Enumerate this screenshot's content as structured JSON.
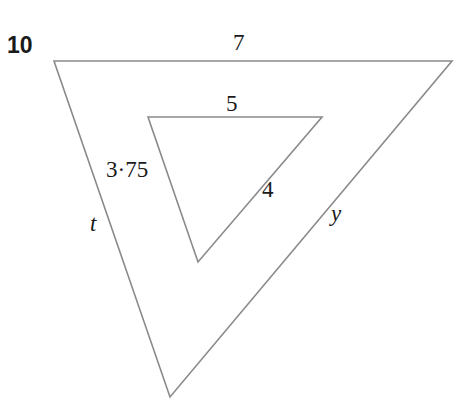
{
  "question_number": "10",
  "outer_triangle": {
    "vertices": {
      "top_left": [
        54,
        61
      ],
      "top_right": [
        452,
        61
      ],
      "bottom": [
        170,
        397
      ]
    },
    "labels": {
      "top": "7",
      "left": "t",
      "right": "y"
    }
  },
  "inner_triangle": {
    "vertices": {
      "top_left": [
        148,
        117
      ],
      "top_right": [
        322,
        117
      ],
      "bottom": [
        198,
        262
      ]
    },
    "labels": {
      "top": "5",
      "left": "3·75",
      "right": "4"
    }
  },
  "colors": {
    "stroke": "#8a8a8a",
    "text": "#1a1a1a",
    "background": "#ffffff"
  }
}
